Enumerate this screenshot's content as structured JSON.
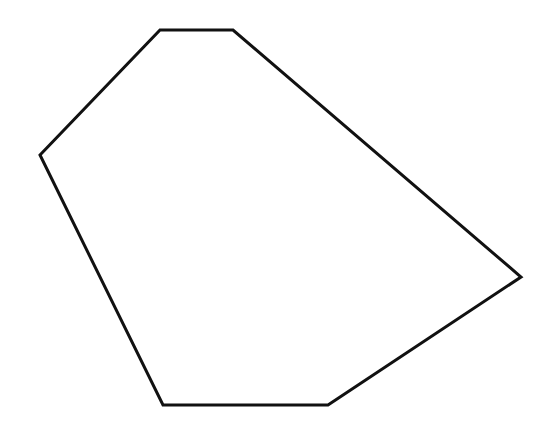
{
  "figure": {
    "shape": "hexagon",
    "stroke_color": "#111111",
    "fill_color": "#ffffff",
    "stroke_width": 3,
    "vertices": [
      {
        "x": 160,
        "y": 30
      },
      {
        "x": 233,
        "y": 30
      },
      {
        "x": 521,
        "y": 277
      },
      {
        "x": 328,
        "y": 405
      },
      {
        "x": 163,
        "y": 405
      },
      {
        "x": 40,
        "y": 155
      }
    ]
  }
}
